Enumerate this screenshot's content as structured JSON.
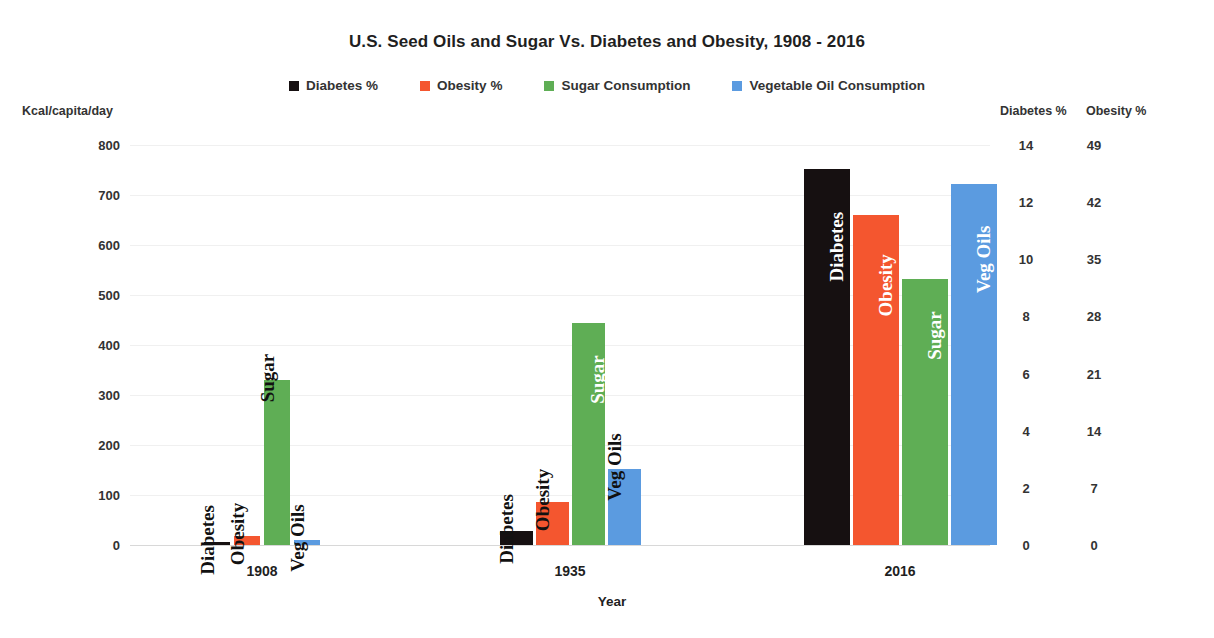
{
  "chart_data": {
    "type": "bar",
    "title": "U.S. Seed Oils and Sugar Vs. Diabetes and Obesity, 1908 - 2016",
    "xlabel": "Year",
    "ylabel": "Kcal/capita/day",
    "categories": [
      "1908",
      "1935",
      "2016"
    ],
    "ylim": [
      0,
      800
    ],
    "yticks": [
      "800",
      "700",
      "600",
      "500",
      "400",
      "300",
      "200",
      "100",
      "0"
    ],
    "grid": true,
    "legend_position": "top-center",
    "secondary_axes": [
      {
        "name": "Diabetes %",
        "ticks": [
          "14",
          "12",
          "10",
          "8",
          "6",
          "4",
          "2",
          "0"
        ],
        "range": [
          0,
          14
        ]
      },
      {
        "name": "Obesity %",
        "ticks": [
          "49",
          "42",
          "35",
          "28",
          "21",
          "14",
          "7",
          "0"
        ],
        "range": [
          0,
          49
        ]
      }
    ],
    "series": [
      {
        "name": "Diabetes %",
        "color": "#161011",
        "bar_label": "Diabetes",
        "values": [
          6,
          28,
          752
        ],
        "real_values": [
          0.2,
          1.0,
          13.2
        ],
        "real_unit": "%"
      },
      {
        "name": "Obesity %",
        "color": "#F4562F",
        "bar_label": "Obesity",
        "values": [
          18,
          86,
          660
        ],
        "real_values": [
          1.1,
          5.3,
          40.4
        ],
        "real_unit": "%"
      },
      {
        "name": "Sugar Consumption",
        "color": "#5FAE55",
        "bar_label": "Sugar",
        "values": [
          330,
          445,
          533
        ],
        "real_values": [
          330,
          445,
          533
        ],
        "real_unit": "Kcal/capita/day"
      },
      {
        "name": "Vegetable Oil Consumption",
        "color": "#5B9BE0",
        "bar_label": "Veg Oils",
        "values": [
          11,
          152,
          723
        ],
        "real_values": [
          11,
          152,
          723
        ],
        "real_unit": "Kcal/capita/day"
      }
    ]
  },
  "legend": {
    "items": [
      {
        "label": "Diabetes %",
        "color": "#161011"
      },
      {
        "label": "Obesity %",
        "color": "#F4562F"
      },
      {
        "label": "Sugar Consumption",
        "color": "#5FAE55"
      },
      {
        "label": "Vegetable Oil Consumption",
        "color": "#5B9BE0"
      }
    ]
  },
  "right_axis_headers": {
    "diabetes": "Diabetes %",
    "obesity": "Obesity %"
  }
}
